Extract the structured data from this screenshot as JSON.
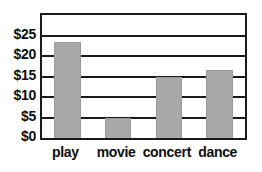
{
  "chart_data": {
    "type": "bar",
    "title": "",
    "subtitle": "",
    "xlabel": "",
    "ylabel": "",
    "categories": [
      "play",
      "movie",
      "concert",
      "dance"
    ],
    "values": [
      23.5,
      5,
      15,
      16.5
    ],
    "value_prefix": "$",
    "ylim": [
      0,
      30
    ],
    "ytick_values": [
      0,
      5,
      10,
      15,
      20,
      25
    ],
    "ytick_labels": [
      "$0",
      "$5",
      "$10",
      "$15",
      "$20",
      "$25"
    ],
    "grid": true,
    "grid_axis": "y",
    "legend": false,
    "legend_position": "none",
    "annotations": [],
    "colors": {
      "bar_fill": "#a9a9a9",
      "bar_edge": "#9a9a9a",
      "axis": "#1a1a1a",
      "grid": "#1a1a1a",
      "text": "#0d0d0d",
      "background": "#ffffff"
    }
  }
}
